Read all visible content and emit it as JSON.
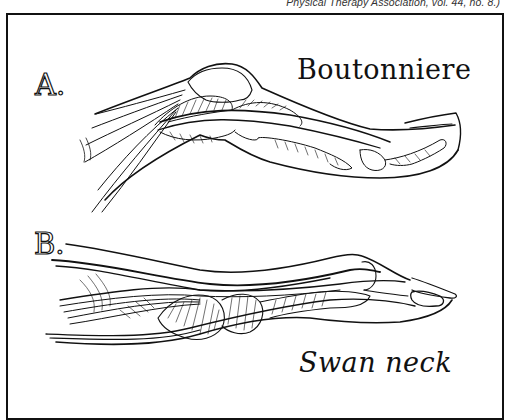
{
  "caption": {
    "text": "Physical Therapy Association, vol. 44, no. 8.)"
  },
  "figure": {
    "panels": [
      {
        "label": "A.",
        "title": "Boutonniere",
        "description": "Finger with boutonniere deformity: PIP joint flexed, DIP hyperextended"
      },
      {
        "label": "B.",
        "title": "Swan neck",
        "description": "Finger with swan neck deformity: PIP hyperextended, DIP flexed"
      }
    ]
  },
  "colors": {
    "ink": "#111111",
    "paper": "#ffffff",
    "caption": "#333333"
  }
}
